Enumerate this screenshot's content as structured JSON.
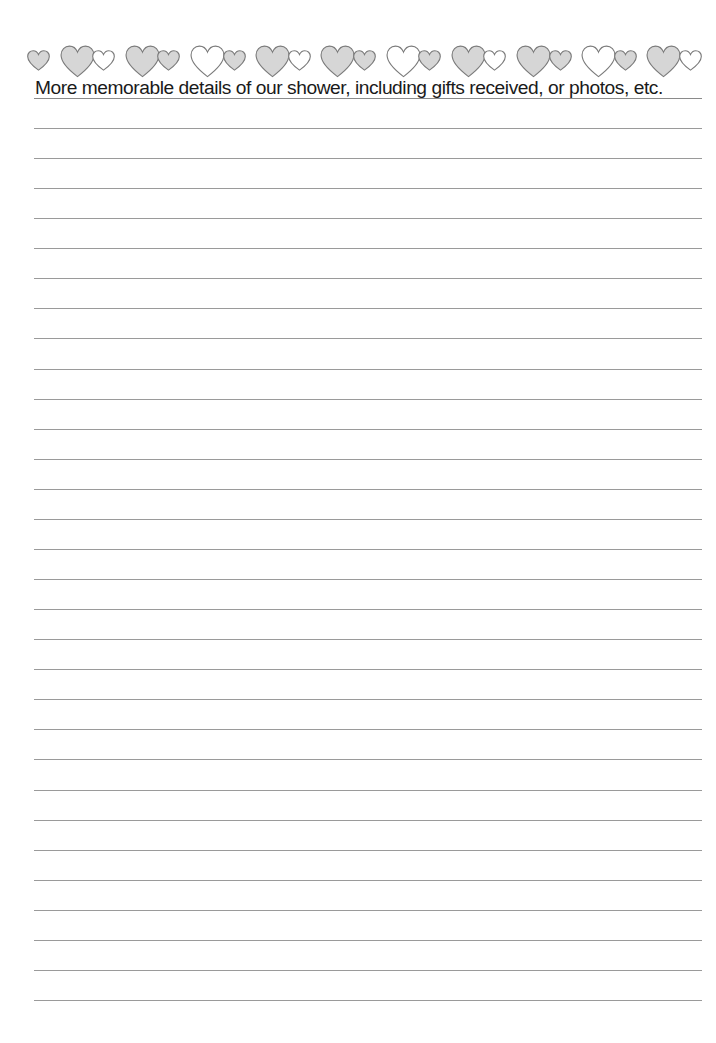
{
  "page": {
    "title": "More memorable details of our shower, including gifts received, or photos, etc.",
    "colors": {
      "heart_fill": "#d6d6d6",
      "heart_white": "#ffffff",
      "heart_stroke": "#7a7a7a",
      "rule": "#9a9a9a",
      "text": "#1a1a1a"
    },
    "border": {
      "icon": "heart-icon",
      "hearts": [
        {
          "size": "small",
          "fill": "gray"
        },
        {
          "size": "large",
          "fill": "gray"
        },
        {
          "size": "small",
          "fill": "white"
        },
        {
          "size": "large",
          "fill": "gray"
        },
        {
          "size": "small",
          "fill": "gray"
        },
        {
          "size": "large",
          "fill": "white"
        },
        {
          "size": "small",
          "fill": "gray"
        },
        {
          "size": "large",
          "fill": "gray"
        },
        {
          "size": "small",
          "fill": "white"
        },
        {
          "size": "large",
          "fill": "gray"
        },
        {
          "size": "small",
          "fill": "gray"
        },
        {
          "size": "large",
          "fill": "white"
        },
        {
          "size": "small",
          "fill": "gray"
        },
        {
          "size": "large",
          "fill": "gray"
        },
        {
          "size": "small",
          "fill": "white"
        },
        {
          "size": "large",
          "fill": "gray"
        },
        {
          "size": "small",
          "fill": "gray"
        },
        {
          "size": "large",
          "fill": "white"
        },
        {
          "size": "small",
          "fill": "gray"
        },
        {
          "size": "large",
          "fill": "gray"
        },
        {
          "size": "small",
          "fill": "white"
        }
      ]
    },
    "ruled_lines": {
      "count": 30,
      "first_y": 128,
      "spacing": 30.07
    }
  }
}
